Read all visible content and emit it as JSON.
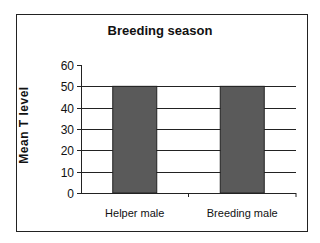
{
  "chart_data": {
    "type": "bar",
    "title": "Breeding season",
    "xlabel": "",
    "ylabel": "Mean T level",
    "categories": [
      "Helper male",
      "Breeding male"
    ],
    "values": [
      50,
      50
    ],
    "ylim": [
      0,
      60
    ],
    "yticks": [
      0,
      10,
      20,
      30,
      40,
      50,
      60
    ],
    "grid": true,
    "legend": null,
    "bar_color": "#5a5a5a"
  },
  "labels": {
    "title": "Breeding season",
    "ylabel": "Mean T level",
    "ytick_0": "0",
    "ytick_10": "10",
    "ytick_20": "20",
    "ytick_30": "30",
    "ytick_40": "40",
    "ytick_50": "50",
    "ytick_60": "60",
    "cat_0": "Helper male",
    "cat_1": "Breeding male"
  }
}
